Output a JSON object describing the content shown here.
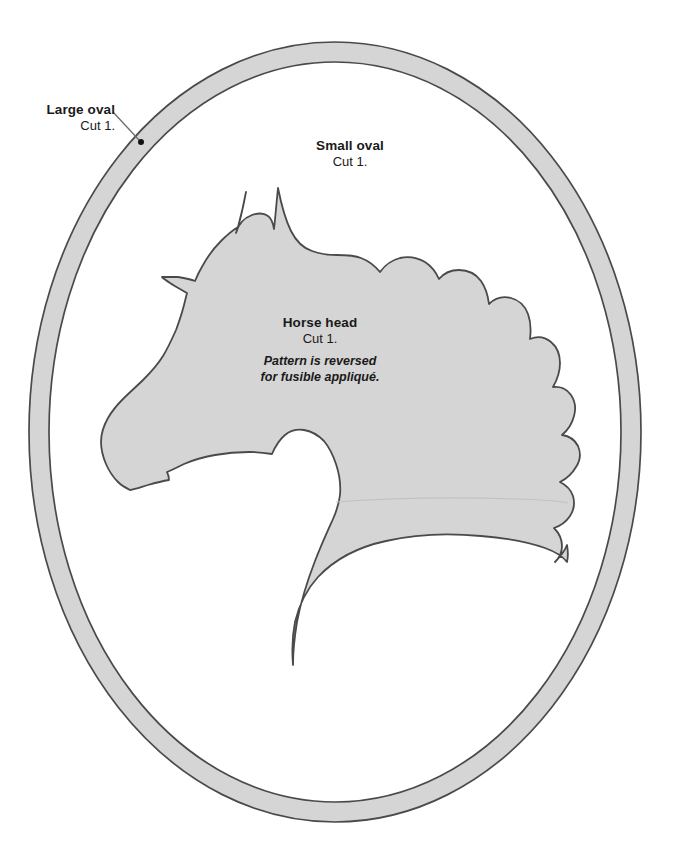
{
  "document": {
    "type": "sewing-pattern-template",
    "title": "Horse head appliqué pattern",
    "page_background": "#ffffff"
  },
  "colors": {
    "shape_fill": "#d5d5d5",
    "shape_outline": "#4a4a4a",
    "text": "#1a1a1a",
    "leader_line": "#6b6b6b",
    "marker_dot": "#111111"
  },
  "labels": {
    "large_oval": {
      "title": "Large oval",
      "cut": "Cut 1.",
      "has_leader_line": true,
      "marker": "registration-dot"
    },
    "small_oval": {
      "title": "Small oval",
      "cut": "Cut 1."
    },
    "horse_head": {
      "title": "Horse head",
      "cut": "Cut 1.",
      "note_line1": "Pattern is reversed",
      "note_line2": "for fusible appliqué."
    }
  },
  "shapes": {
    "large_oval": {
      "name": "large-oval-outline",
      "cx": 335,
      "cy": 432,
      "rx": 306,
      "ry": 390
    },
    "small_oval": {
      "name": "small-oval-outline",
      "cx": 335,
      "cy": 432,
      "rx": 286,
      "ry": 370
    },
    "horse_head": {
      "name": "horse-head-silhouette"
    }
  }
}
